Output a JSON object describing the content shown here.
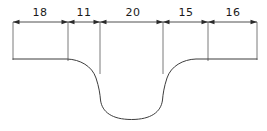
{
  "drawing": {
    "type": "engineering-dimension-drawing",
    "description": "Part cross-section profile with a rounded central groove and a linear chain dimension line above",
    "units_note": "",
    "dimension_line": {
      "y": 22,
      "start_x": 13,
      "end_x": 257,
      "style": "chain-dimension-with-filled-arrowheads"
    },
    "dimensions": [
      {
        "label": "18",
        "value": 18,
        "x1": 13,
        "x2": 68,
        "text_x": 40,
        "text_y": 16
      },
      {
        "label": "11",
        "value": 11,
        "x1": 68,
        "x2": 100,
        "text_x": 84,
        "text_y": 16
      },
      {
        "label": "20",
        "value": 20,
        "x1": 100,
        "x2": 163,
        "text_x": 133,
        "text_y": 16
      },
      {
        "label": "15",
        "value": 15,
        "x1": 163,
        "x2": 208,
        "text_x": 186,
        "text_y": 16
      },
      {
        "label": "16",
        "value": 16,
        "x1": 208,
        "x2": 257,
        "text_x": 233,
        "text_y": 16
      }
    ],
    "extension_lines": [
      {
        "name": "ext-left-end",
        "x": 13,
        "y1": 22,
        "y2": 60
      },
      {
        "name": "ext-18-11",
        "x": 68,
        "y1": 22,
        "y2": 61
      },
      {
        "name": "ext-11-20",
        "x": 100,
        "y1": 22,
        "y2": 74
      },
      {
        "name": "ext-20-15",
        "x": 163,
        "y1": 22,
        "y2": 74
      },
      {
        "name": "ext-15-16",
        "x": 208,
        "y1": 22,
        "y2": 61
      },
      {
        "name": "ext-right-end",
        "x": 257,
        "y1": 22,
        "y2": 60
      }
    ],
    "profile": {
      "top_surface_y": 59,
      "groove_bottom_y": 119,
      "left_flat": {
        "x1": 13,
        "x2": 68
      },
      "right_flat": {
        "x1": 208,
        "x2": 257
      },
      "path": "M 13 59 L 67 59 C 80 59.5 92 66 96 78 C 99 87 100 94 100.5 100 C 102 112 112 119.5 131.5 119.5 C 151 119.5 161 112 162.5 100 C 163 94 164 87 167 78 C 171 66 183 59.5 196 59 L 257 59"
    },
    "colors": {
      "line": "#4a4a4a",
      "profile": "#3d3d3d",
      "arrow": "#2b2b2b",
      "text": "#1a1a1a",
      "background": "#ffffff"
    }
  }
}
